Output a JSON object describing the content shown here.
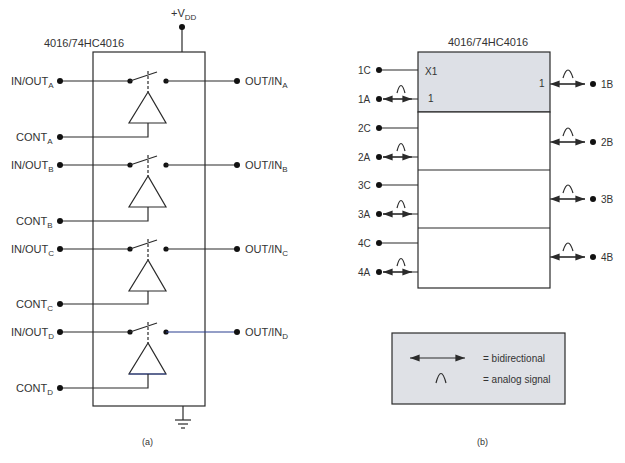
{
  "figure_a": {
    "chip_label": "4016/74HC4016",
    "supply": {
      "label": "+V",
      "sub": "DD"
    },
    "caption": "(a)",
    "channels": [
      {
        "id": "A",
        "in_out": "IN/OUT",
        "out_in": "OUT/IN",
        "cont": "CONT",
        "sub": "A"
      },
      {
        "id": "B",
        "in_out": "IN/OUT",
        "out_in": "OUT/IN",
        "cont": "CONT",
        "sub": "B"
      },
      {
        "id": "C",
        "in_out": "IN/OUT",
        "out_in": "OUT/IN",
        "cont": "CONT",
        "sub": "C"
      },
      {
        "id": "D",
        "in_out": "IN/OUT",
        "out_in": "OUT/IN",
        "cont": "CONT",
        "sub": "D"
      }
    ]
  },
  "figure_b": {
    "chip_label": "4016/74HC4016",
    "header_left_top": "X1",
    "header_left_bottom": "1",
    "header_right": "1",
    "caption": "(b)",
    "pins": [
      {
        "control": "1C",
        "input": "1A",
        "output": "1B"
      },
      {
        "control": "2C",
        "input": "2A",
        "output": "2B"
      },
      {
        "control": "3C",
        "input": "3A",
        "output": "3B"
      },
      {
        "control": "4C",
        "input": "4A",
        "output": "4B"
      }
    ],
    "legend": {
      "bidirectional": "= bidirectional",
      "analog": "= analog signal"
    }
  },
  "colors": {
    "line": "#2b2b2b",
    "box_fill_shaded": "#dde0e6",
    "legend_fill": "#dfe1e6"
  }
}
